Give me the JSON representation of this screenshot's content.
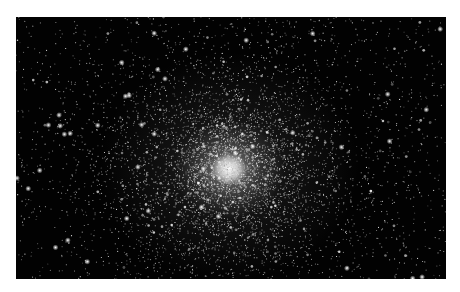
{
  "image": {
    "subject": "globular star cluster",
    "background_color": "#020202",
    "frame_color": "#ffffff",
    "core": {
      "x": 213,
      "y": 152,
      "color": "#ffffff"
    }
  }
}
